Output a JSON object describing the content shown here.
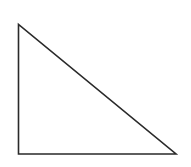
{
  "diagram": {
    "shape": "right-triangle",
    "stroke_color": "#2a2a2a",
    "fill_color": "#ffffff",
    "stroke_width": 1.6,
    "vertices": [
      {
        "name": "top",
        "x": 18.5,
        "y": 24.5
      },
      {
        "name": "bottom-left",
        "x": 18.5,
        "y": 154
      },
      {
        "name": "bottom-right",
        "x": 176,
        "y": 154
      }
    ]
  }
}
